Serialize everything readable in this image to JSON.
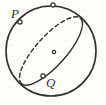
{
  "figure": {
    "kind": "geometry-diagram",
    "background_color": "#fdfdfb",
    "stroke_color": "#2e2e2e",
    "labels": [
      {
        "id": "P",
        "text": "P",
        "x": 11,
        "y": 7
      },
      {
        "id": "Q",
        "text": "Q",
        "x": 46,
        "y": 76
      }
    ],
    "sphere": {
      "name": "sphere-outline",
      "cx": 51,
      "cy": 51,
      "r": 45,
      "stroke_width": 1.6,
      "style": "solid"
    },
    "great_circle": {
      "name": "great-circle",
      "cx": 51,
      "cy": 51,
      "rx": 44,
      "ry": 15,
      "rotation_deg": -48,
      "front_style": "solid",
      "back_style": "dashed",
      "dash_pattern": "4,3",
      "stroke_width": 1.4
    },
    "markers": [
      {
        "id": "marker-top",
        "name": "point-marker-top",
        "cx": 53,
        "cy": 5,
        "r": 2.1
      },
      {
        "id": "marker-p",
        "name": "point-marker-p",
        "cx": 20,
        "cy": 22,
        "r": 2.1
      },
      {
        "id": "marker-q",
        "name": "point-marker-q",
        "cx": 43,
        "cy": 76,
        "r": 2.1
      },
      {
        "id": "marker-center",
        "name": "sphere-center-dot",
        "cx": 54,
        "cy": 52,
        "r": 1.7
      }
    ]
  }
}
